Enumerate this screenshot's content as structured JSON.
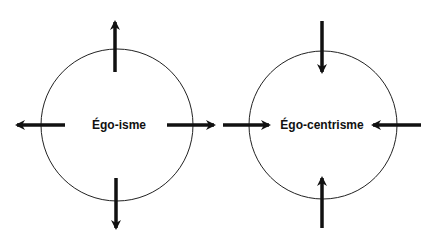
{
  "diagram": {
    "left": {
      "label": "Égo-isme",
      "arrow_direction": "outward"
    },
    "right": {
      "label": "Égo-centrisme",
      "arrow_direction": "inward"
    }
  },
  "colors": {
    "stroke": "#111111",
    "background": "#ffffff"
  }
}
